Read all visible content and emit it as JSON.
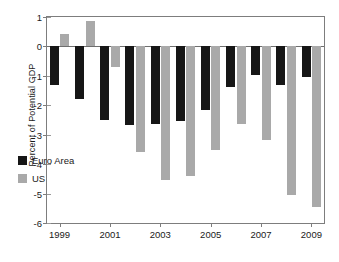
{
  "chart_data": {
    "type": "bar",
    "title": "",
    "xlabel": "",
    "ylabel": "Percent of Potential GDP",
    "ylim": [
      -6,
      1
    ],
    "yticks": [
      1,
      0,
      -1,
      -2,
      -3,
      -4,
      -5,
      -6
    ],
    "ytick_labels": [
      "1",
      "0",
      "-1",
      "-2",
      "-3",
      "-4",
      "-5",
      "-6"
    ],
    "grid": false,
    "legend_position": "inside-lower-left",
    "categories": [
      1999,
      2000,
      2001,
      2002,
      2003,
      2004,
      2005,
      2006,
      2007,
      2008,
      2009
    ],
    "xtick_labels": [
      "1999",
      "2001",
      "2003",
      "2005",
      "2007",
      "2009"
    ],
    "xtick_categories": [
      1999,
      2001,
      2003,
      2005,
      2007,
      2009
    ],
    "series": [
      {
        "name": "Euro Area",
        "color": "#161616",
        "values": [
          -1.32,
          -1.79,
          -2.49,
          -2.68,
          -2.64,
          -2.53,
          -2.16,
          -1.37,
          -0.97,
          -1.32,
          -1.05
        ]
      },
      {
        "name": "US",
        "color": "#a9a9a9",
        "values": [
          0.42,
          0.85,
          -0.69,
          -3.58,
          -4.55,
          -4.42,
          -3.53,
          -2.63,
          -3.17,
          -5.06,
          -5.44
        ]
      }
    ]
  },
  "legend": {
    "items": [
      {
        "label": "Euro Area",
        "color": "#161616"
      },
      {
        "label": "US",
        "color": "#a9a9a9"
      }
    ]
  },
  "axes": {
    "y_title": "Percent of Potential GDP"
  }
}
